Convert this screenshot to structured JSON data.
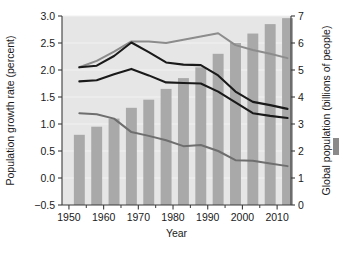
{
  "chart_data": {
    "type": "bar",
    "title": "",
    "subtitle": "",
    "xlabel": "Year",
    "ylabel": "Population growth rate (percent)",
    "y2label": "Global population (billions of people)",
    "xlim": [
      1948,
      2014
    ],
    "ylim": [
      -0.5,
      3.0
    ],
    "y2lim": [
      0,
      7
    ],
    "grid": true,
    "legend_position": "none",
    "x_ticks": [
      1950,
      1960,
      1970,
      1980,
      1990,
      2000,
      2010
    ],
    "x_tick_labels": [
      "1950",
      "1960",
      "1970",
      "1980",
      "1990",
      "2000",
      "2010"
    ],
    "x_minor_ticks": [
      1955,
      1965,
      1975,
      1985,
      1995,
      2005
    ],
    "y_ticks": [
      -0.5,
      0.0,
      0.5,
      1.0,
      1.5,
      2.0,
      2.5,
      3.0
    ],
    "y_tick_labels": [
      "−0.5",
      "0.0",
      "0.5",
      "1.0",
      "1.5",
      "2.0",
      "2.5",
      "3.0"
    ],
    "y2_ticks": [
      0,
      1,
      2,
      3,
      4,
      5,
      6,
      7
    ],
    "y2_tick_labels": [
      "0",
      "1",
      "2",
      "3",
      "4",
      "5",
      "6",
      "7"
    ],
    "bars": {
      "name": "Global population",
      "axis": "right",
      "color": "#a9a9a9",
      "categories": [
        1953,
        1958,
        1963,
        1968,
        1973,
        1978,
        1983,
        1988,
        1993,
        1998,
        2003,
        2008,
        2013
      ],
      "values": [
        2.6,
        2.9,
        3.2,
        3.6,
        3.9,
        4.3,
        4.7,
        5.1,
        5.6,
        6.0,
        6.35,
        6.7,
        6.92
      ]
    },
    "series": [
      {
        "name": "Upper gray line",
        "axis": "left",
        "color": "#8c8c8c",
        "width": 2.0,
        "x": [
          1953,
          1958,
          1963,
          1968,
          1973,
          1978,
          1983,
          1988,
          1993,
          1998,
          2003,
          2008,
          2013
        ],
        "values": [
          2.05,
          2.17,
          2.34,
          2.53,
          2.53,
          2.5,
          2.56,
          2.62,
          2.68,
          2.46,
          2.37,
          2.3,
          2.22
        ]
      },
      {
        "name": "Upper dark line",
        "axis": "left",
        "color": "#1a1a1a",
        "width": 2.1,
        "x": [
          1953,
          1958,
          1963,
          1968,
          1973,
          1978,
          1983,
          1988,
          1993,
          1998,
          2003,
          2008,
          2013
        ],
        "values": [
          2.05,
          2.08,
          2.26,
          2.51,
          2.33,
          2.14,
          2.1,
          2.09,
          1.9,
          1.6,
          1.41,
          1.35,
          1.28
        ]
      },
      {
        "name": "Lower dark line",
        "axis": "left",
        "color": "#1a1a1a",
        "width": 2.1,
        "x": [
          1953,
          1958,
          1963,
          1968,
          1973,
          1978,
          1983,
          1988,
          1993,
          1998,
          2003,
          2008,
          2013
        ],
        "values": [
          1.79,
          1.81,
          1.92,
          2.02,
          1.9,
          1.77,
          1.76,
          1.75,
          1.6,
          1.4,
          1.2,
          1.15,
          1.11
        ]
      },
      {
        "name": "Lower gray line",
        "axis": "left",
        "color": "#6e6e6e",
        "width": 2.0,
        "x": [
          1953,
          1958,
          1963,
          1968,
          1973,
          1978,
          1983,
          1988,
          1993,
          1998,
          2003,
          2008,
          2013
        ],
        "values": [
          1.2,
          1.18,
          1.1,
          0.85,
          0.78,
          0.7,
          0.59,
          0.61,
          0.5,
          0.33,
          0.32,
          0.27,
          0.22
        ]
      }
    ]
  }
}
